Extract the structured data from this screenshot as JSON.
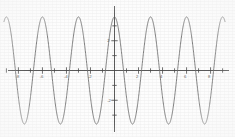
{
  "chart_data": {
    "type": "line",
    "title": "",
    "subtitle": "",
    "xlabel": "",
    "ylabel": "",
    "grid": false,
    "legend": "none",
    "axis_style": "centered-cross",
    "line_color": "#6b6b6b",
    "background_color": "#fdfdfd",
    "axis_color": "#4a4a4a",
    "xlim": [
      -9.2,
      9.2
    ],
    "ylim": [
      -4.2,
      4.2
    ],
    "x_ticks": [
      -8,
      -6,
      -4,
      -2,
      2,
      4,
      6,
      8
    ],
    "x_tick_labels": [
      "-8",
      "-6",
      "-4",
      "-2",
      "2",
      "4",
      "6",
      "8"
    ],
    "x_minor_ticks": [
      -9,
      -7,
      -5,
      -3,
      -1,
      1,
      3,
      5,
      7,
      9
    ],
    "y_ticks": [
      2,
      -2
    ],
    "y_tick_labels": [
      "2",
      "-2"
    ],
    "y_minor_ticks": [
      3,
      1,
      -1,
      -3
    ],
    "series": [
      {
        "name": "wave",
        "function": "cosine",
        "amplitude": 3.6,
        "period": 3.0,
        "phase": 0,
        "vertical_offset": 0,
        "peaks_x": [
          -7.5,
          -4.5,
          -1.5,
          1.5,
          4.5,
          7.5
        ],
        "peak_value": 3.6,
        "troughs_x": [
          -9.0,
          -6.0,
          -3.0,
          0.0,
          3.0,
          6.0,
          9.0
        ],
        "trough_value": -3.6,
        "zero_crossings_x": [
          -8.25,
          -6.75,
          -5.25,
          -3.75,
          -2.25,
          -0.75,
          0.75,
          2.25,
          3.75,
          5.25,
          6.75,
          8.25
        ],
        "visible_full_periods": 6
      }
    ]
  },
  "figure": {
    "caption": "",
    "alt": "Graph of a high-frequency cosine wave with amplitude 3.6 and period 3 on centered x and y axes."
  }
}
